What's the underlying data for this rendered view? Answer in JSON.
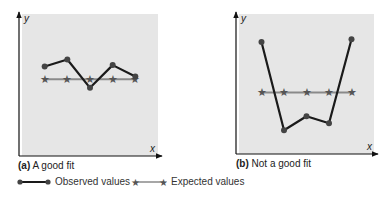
{
  "chart_data": [
    {
      "type": "line",
      "title": "A good fit",
      "panel_label": "(a)",
      "xlabel": "x",
      "ylabel": "y",
      "x": [
        1,
        2,
        3,
        4,
        5
      ],
      "ylim": [
        0,
        10
      ],
      "xlim": [
        0,
        6
      ],
      "grid": false,
      "series": [
        {
          "name": "Observed values",
          "marker": "circle",
          "values": [
            6.3,
            6.8,
            4.8,
            6.4,
            5.6
          ]
        },
        {
          "name": "Expected values",
          "marker": "star",
          "values": [
            5.4,
            5.4,
            5.4,
            5.4,
            5.4
          ]
        }
      ]
    },
    {
      "type": "line",
      "title": "Not a good fit",
      "panel_label": "(b)",
      "xlabel": "x",
      "ylabel": "y",
      "x": [
        1,
        2,
        3,
        4,
        5
      ],
      "ylim": [
        0,
        10
      ],
      "xlim": [
        0,
        6
      ],
      "grid": false,
      "series": [
        {
          "name": "Observed values",
          "marker": "circle",
          "values": [
            8.0,
            1.7,
            2.7,
            2.2,
            8.2
          ]
        },
        {
          "name": "Expected values",
          "marker": "star",
          "values": [
            4.4,
            4.4,
            4.4,
            4.4,
            4.4
          ]
        }
      ]
    }
  ],
  "legend": {
    "placement": "bottom-left",
    "items": [
      {
        "label": "Observed values",
        "marker": "circle"
      },
      {
        "label": "Expected values",
        "marker": "star"
      }
    ]
  },
  "colors": {
    "panel": "#e6e6e6",
    "observed": "#1a1a1a",
    "observed_marker": "#444444",
    "expected_line": "#8a8a8a",
    "expected_marker": "#555555",
    "axis": "#111111"
  }
}
